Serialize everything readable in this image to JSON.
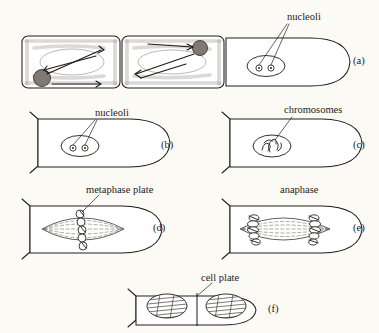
{
  "figure": {
    "background_color": "#fbfaf5",
    "ink_color": "#221f1c",
    "panel_count": 6
  },
  "labels": {
    "nucleoli_a": "nucleoli",
    "nucleoli_b": "nucleoli",
    "chromosomes_c": "chromosomes",
    "metaphase_plate_d": "metaphase plate",
    "anaphase_e": "anaphase",
    "cell_plate_f": "cell plate"
  },
  "panels": [
    {
      "letter": "(a)",
      "row": 1,
      "column": "full",
      "description": "Row of three elongated root-tip cells; two left cells show stippled cytoplasm with dark nuclei and arrows indicating cytoplasmic streaming; right cell shows a clear oval nucleus with two nucleoli",
      "label": "nucleoli",
      "cells_in_panel": 3,
      "nucleoli_count": 2
    },
    {
      "letter": "(b)",
      "row": 2,
      "column": "left",
      "description": "Interphase cell with oval nucleus containing two nucleoli",
      "label": "nucleoli",
      "nucleoli_count": 2
    },
    {
      "letter": "(c)",
      "row": 2,
      "column": "right",
      "description": "Prophase cell; nucleus contains condensing thread-like chromosomes",
      "label": "chromosomes",
      "nucleoli_count": 0
    },
    {
      "letter": "(d)",
      "row": 3,
      "column": "left",
      "description": "Metaphase cell; spindle formed with chromosomes aligned on the metaphase plate at the equator",
      "label": "metaphase plate"
    },
    {
      "letter": "(e)",
      "row": 3,
      "column": "right",
      "description": "Anaphase cell; two sets of chromosomes moved to opposite poles along spindle fibers",
      "label": "anaphase"
    },
    {
      "letter": "(f)",
      "row": 4,
      "column": "center",
      "description": "Telophase / cytokinesis; two daughter cells separated by a newly formed cell plate, each containing a hatched nucleus",
      "label": "cell plate"
    }
  ]
}
